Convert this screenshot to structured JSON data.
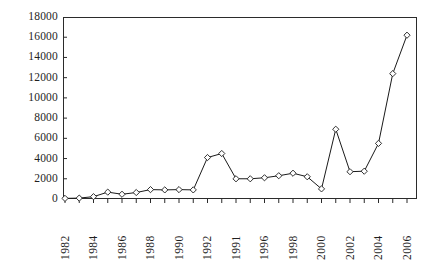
{
  "chart_data": {
    "type": "line",
    "title": "",
    "subtitle": "",
    "xlabel": "",
    "ylabel": "",
    "grid": false,
    "legend": "none",
    "marker": "open-diamond",
    "line_color": "#1a1a1a",
    "marker_fill": "#ffffff",
    "ylim": [
      0,
      18000
    ],
    "y_ticks": [
      0,
      2000,
      4000,
      6000,
      8000,
      10000,
      12000,
      14000,
      16000,
      18000
    ],
    "y_tick_labels": [
      "0",
      "2000",
      "4000",
      "6000",
      "8000",
      "10000",
      "12000",
      "14000",
      "16000",
      "18000"
    ],
    "x_tick_labels_visible": [
      "1982",
      "1984",
      "1986",
      "1988",
      "1990",
      "1992",
      "1991",
      "1996",
      "1998",
      "2000",
      "2002",
      "2004",
      "2006"
    ],
    "x_tick_label_note": "Labels are drawn rotated 90 degrees; every other year is labelled. The 7th label reads 1991 in the source image though its position corresponds to 1994.",
    "categories": [
      "1982",
      "1983",
      "1984",
      "1985",
      "1986",
      "1987",
      "1988",
      "1989",
      "1990",
      "1991",
      "1992",
      "1993",
      "1994",
      "1995",
      "1996",
      "1997",
      "1998",
      "1999",
      "2000",
      "2001",
      "2002",
      "2003",
      "2004",
      "2005",
      "2006"
    ],
    "values": [
      60,
      90,
      230,
      680,
      470,
      640,
      930,
      900,
      930,
      900,
      4100,
      4500,
      2000,
      2000,
      2100,
      2300,
      2550,
      2200,
      1000,
      6900,
      2700,
      2750,
      5500,
      12400,
      16200
    ]
  }
}
